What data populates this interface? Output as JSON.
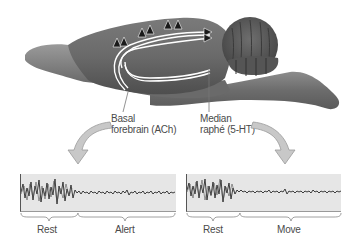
{
  "figure": {
    "regions": {
      "basal_forebrain": {
        "line1": "Basal",
        "line2": "forebrain (ACh)"
      },
      "median_raphe": {
        "line1": "Median",
        "line2": "raphé (5-HT)"
      }
    },
    "eeg_panels": [
      {
        "segments": [
          {
            "label": "Rest"
          },
          {
            "label": "Alert"
          }
        ]
      },
      {
        "segments": [
          {
            "label": "Rest"
          },
          {
            "label": "Move"
          }
        ]
      }
    ],
    "colors": {
      "brain_dark": "#5a5a5a",
      "brain_mid": "#8a8a8a",
      "brain_light": "#b8b8b8",
      "arrow_fill": "#c8c8c8",
      "eeg_bg": "#e6e6e6",
      "trace": "#2a2a2a"
    }
  }
}
